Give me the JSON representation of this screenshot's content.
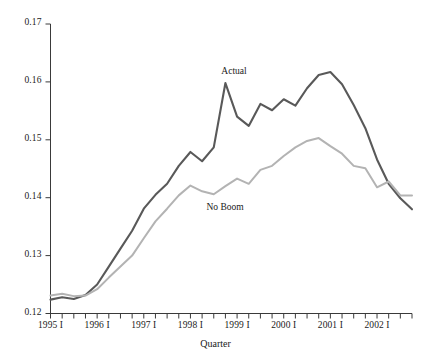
{
  "chart_data": {
    "type": "line",
    "title": "",
    "xlabel": "Quarter",
    "ylabel": "",
    "grid": false,
    "legend_position": "inline-annotation",
    "ylim": [
      0.12,
      0.17
    ],
    "ytick_labels": [
      "0.17",
      "0.16",
      "0.15",
      "0.14",
      "0.13",
      "0.12"
    ],
    "ytick_values": [
      0.17,
      0.16,
      0.15,
      0.14,
      0.13,
      0.12
    ],
    "xtick_labels": [
      "1995 I",
      "1996 I",
      "1997 I",
      "1998 I",
      "1999 I",
      "2000 I",
      "2001 I",
      "2002 I"
    ],
    "x_minor_ticks_per_label": 4,
    "x": [
      "1995 I",
      "1995 II",
      "1995 III",
      "1995 IV",
      "1996 I",
      "1996 II",
      "1996 III",
      "1996 IV",
      "1997 I",
      "1997 II",
      "1997 III",
      "1997 IV",
      "1998 I",
      "1998 II",
      "1998 III",
      "1998 IV",
      "1999 I",
      "1999 II",
      "1999 III",
      "1999 IV",
      "2000 I",
      "2000 II",
      "2000 III",
      "2000 IV",
      "2001 I",
      "2001 II",
      "2001 III",
      "2001 IV",
      "2002 I",
      "2002 II",
      "2002 III",
      "2002 IV"
    ],
    "series": [
      {
        "name": "Actual",
        "color": "#595959",
        "values": [
          0.1224,
          0.1228,
          0.1225,
          0.1232,
          0.125,
          0.1281,
          0.1312,
          0.1343,
          0.1381,
          0.1405,
          0.1424,
          0.1455,
          0.1479,
          0.1463,
          0.1487,
          0.1598,
          0.154,
          0.1524,
          0.1562,
          0.1551,
          0.157,
          0.1559,
          0.1589,
          0.1612,
          0.1617,
          0.1596,
          0.156,
          0.152,
          0.1466,
          0.1424,
          0.1399,
          0.138
        ]
      },
      {
        "name": "No Boom",
        "color": "#b3b3b3",
        "values": [
          0.1231,
          0.1234,
          0.123,
          0.1231,
          0.1242,
          0.1262,
          0.1281,
          0.13,
          0.133,
          0.1359,
          0.1381,
          0.1404,
          0.1421,
          0.1411,
          0.1406,
          0.142,
          0.1433,
          0.1424,
          0.1448,
          0.1455,
          0.1472,
          0.1487,
          0.1498,
          0.1503,
          0.1489,
          0.1476,
          0.1455,
          0.1451,
          0.1418,
          0.1428,
          0.1404,
          0.1404
        ]
      }
    ],
    "annotations": [
      {
        "text": "Actual",
        "series": "Actual"
      },
      {
        "text": "No Boom",
        "series": "No Boom"
      }
    ]
  }
}
